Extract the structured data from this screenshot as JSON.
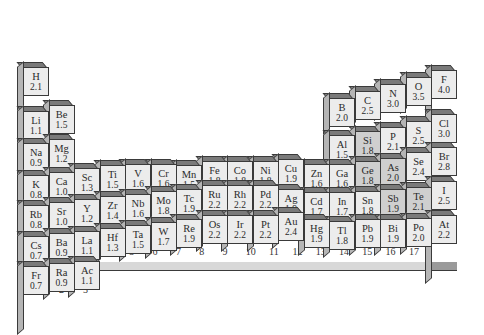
{
  "chart_data": {
    "type": "bar",
    "xlabel": "Group",
    "ylabel": "Electronegativity",
    "groups": [
      "1",
      "2",
      "3",
      "4",
      "5",
      "6",
      "7",
      "8",
      "9",
      "10",
      "11",
      "12",
      "13",
      "14",
      "15",
      "16",
      "17"
    ],
    "elements": [
      {
        "symbol": "H",
        "value": "2.1",
        "group": 1,
        "period": 1
      },
      {
        "symbol": "Li",
        "value": "1.1",
        "group": 1,
        "period": 2
      },
      {
        "symbol": "Be",
        "value": "1.5",
        "group": 2,
        "period": 2
      },
      {
        "symbol": "B",
        "value": "2.0",
        "group": 13,
        "period": 2
      },
      {
        "symbol": "C",
        "value": "2.5",
        "group": 14,
        "period": 2
      },
      {
        "symbol": "N",
        "value": "3.0",
        "group": 15,
        "period": 2
      },
      {
        "symbol": "O",
        "value": "3.5",
        "group": 16,
        "period": 2
      },
      {
        "symbol": "F",
        "value": "4.0",
        "group": 17,
        "period": 2
      },
      {
        "symbol": "Na",
        "value": "0.9",
        "group": 1,
        "period": 3
      },
      {
        "symbol": "Mg",
        "value": "1.2",
        "group": 2,
        "period": 3
      },
      {
        "symbol": "Al",
        "value": "1.5",
        "group": 13,
        "period": 3
      },
      {
        "symbol": "Si",
        "value": "1.8",
        "group": 14,
        "period": 3
      },
      {
        "symbol": "P",
        "value": "2.1",
        "group": 15,
        "period": 3
      },
      {
        "symbol": "S",
        "value": "2.5",
        "group": 16,
        "period": 3
      },
      {
        "symbol": "Cl",
        "value": "3.0",
        "group": 17,
        "period": 3
      },
      {
        "symbol": "K",
        "value": "0.8",
        "group": 1,
        "period": 4
      },
      {
        "symbol": "Ca",
        "value": "1.0",
        "group": 2,
        "period": 4
      },
      {
        "symbol": "Sc",
        "value": "1.3",
        "group": 3,
        "period": 4
      },
      {
        "symbol": "Ti",
        "value": "1.5",
        "group": 4,
        "period": 4
      },
      {
        "symbol": "V",
        "value": "1.6",
        "group": 5,
        "period": 4
      },
      {
        "symbol": "Cr",
        "value": "1.6",
        "group": 6,
        "period": 4
      },
      {
        "symbol": "Mn",
        "value": "1.5",
        "group": 7,
        "period": 4
      },
      {
        "symbol": "Fe",
        "value": "1.8",
        "group": 8,
        "period": 4
      },
      {
        "symbol": "Co",
        "value": "1.8",
        "group": 9,
        "period": 4
      },
      {
        "symbol": "Ni",
        "value": "1.8",
        "group": 10,
        "period": 4
      },
      {
        "symbol": "Cu",
        "value": "1.9",
        "group": 11,
        "period": 4
      },
      {
        "symbol": "Zn",
        "value": "1.6",
        "group": 12,
        "period": 4
      },
      {
        "symbol": "Ga",
        "value": "1.6",
        "group": 13,
        "period": 4
      },
      {
        "symbol": "Ge",
        "value": "1.8",
        "group": 14,
        "period": 4
      },
      {
        "symbol": "As",
        "value": "2.0",
        "group": 15,
        "period": 4
      },
      {
        "symbol": "Se",
        "value": "2.4",
        "group": 16,
        "period": 4
      },
      {
        "symbol": "Br",
        "value": "2.8",
        "group": 17,
        "period": 4
      },
      {
        "symbol": "Rb",
        "value": "0.8",
        "group": 1,
        "period": 5
      },
      {
        "symbol": "Sr",
        "value": "1.0",
        "group": 2,
        "period": 5
      },
      {
        "symbol": "Y",
        "value": "1.2",
        "group": 3,
        "period": 5
      },
      {
        "symbol": "Zr",
        "value": "1.4",
        "group": 4,
        "period": 5
      },
      {
        "symbol": "Nb",
        "value": "1.6",
        "group": 5,
        "period": 5
      },
      {
        "symbol": "Mo",
        "value": "1.8",
        "group": 6,
        "period": 5
      },
      {
        "symbol": "Tc",
        "value": "1.9",
        "group": 7,
        "period": 5
      },
      {
        "symbol": "Ru",
        "value": "2.2",
        "group": 8,
        "period": 5
      },
      {
        "symbol": "Rh",
        "value": "2.2",
        "group": 9,
        "period": 5
      },
      {
        "symbol": "Pd",
        "value": "2.2",
        "group": 10,
        "period": 5
      },
      {
        "symbol": "Ag",
        "value": "1.9",
        "group": 11,
        "period": 5
      },
      {
        "symbol": "Cd",
        "value": "1.7",
        "group": 12,
        "period": 5
      },
      {
        "symbol": "In",
        "value": "1.7",
        "group": 13,
        "period": 5
      },
      {
        "symbol": "Sn",
        "value": "1.8",
        "group": 14,
        "period": 5
      },
      {
        "symbol": "Sb",
        "value": "1.9",
        "group": 15,
        "period": 5
      },
      {
        "symbol": "Te",
        "value": "2.1",
        "group": 16,
        "period": 5
      },
      {
        "symbol": "I",
        "value": "2.5",
        "group": 17,
        "period": 5
      },
      {
        "symbol": "Cs",
        "value": "0.7",
        "group": 1,
        "period": 6
      },
      {
        "symbol": "Ba",
        "value": "0.9",
        "group": 2,
        "period": 6
      },
      {
        "symbol": "La",
        "value": "1.1",
        "group": 3,
        "period": 6
      },
      {
        "symbol": "Hf",
        "value": "1.3",
        "group": 4,
        "period": 6
      },
      {
        "symbol": "Ta",
        "value": "1.5",
        "group": 5,
        "period": 6
      },
      {
        "symbol": "W",
        "value": "1.7",
        "group": 6,
        "period": 6
      },
      {
        "symbol": "Re",
        "value": "1.9",
        "group": 7,
        "period": 6
      },
      {
        "symbol": "Os",
        "value": "2.2",
        "group": 8,
        "period": 6
      },
      {
        "symbol": "Ir",
        "value": "2.2",
        "group": 9,
        "period": 6
      },
      {
        "symbol": "Pt",
        "value": "2.2",
        "group": 10,
        "period": 6
      },
      {
        "symbol": "Au",
        "value": "2.4",
        "group": 11,
        "period": 6
      },
      {
        "symbol": "Hg",
        "value": "1.9",
        "group": 12,
        "period": 6
      },
      {
        "symbol": "Tl",
        "value": "1.8",
        "group": 13,
        "period": 6
      },
      {
        "symbol": "Pb",
        "value": "1.9",
        "group": 14,
        "period": 6
      },
      {
        "symbol": "Bi",
        "value": "1.9",
        "group": 15,
        "period": 6
      },
      {
        "symbol": "Po",
        "value": "2.0",
        "group": 16,
        "period": 6
      },
      {
        "symbol": "At",
        "value": "2.2",
        "group": 17,
        "period": 6
      },
      {
        "symbol": "Fr",
        "value": "0.7",
        "group": 1,
        "period": 7
      },
      {
        "symbol": "Ra",
        "value": "0.9",
        "group": 2,
        "period": 7
      },
      {
        "symbol": "Ac",
        "value": "1.1",
        "group": 3,
        "period": 7
      }
    ],
    "grid": false,
    "legend": "none"
  }
}
